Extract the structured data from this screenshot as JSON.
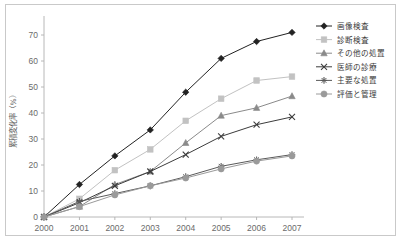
{
  "chart_data": {
    "type": "line",
    "title": "",
    "subtitle": "",
    "xlabel": "",
    "ylabel": "累積変化率（%）",
    "categories": [
      "2000",
      "2001",
      "2002",
      "2003",
      "2004",
      "2005",
      "2006",
      "2007"
    ],
    "x": [
      2000,
      2001,
      2002,
      2003,
      2004,
      2005,
      2006,
      2007
    ],
    "xlim": [
      2000,
      2007
    ],
    "ylim": [
      0,
      75
    ],
    "yticks": [
      0,
      10,
      20,
      30,
      40,
      50,
      60,
      70
    ],
    "ytick_labels": [
      "0",
      "10",
      "20",
      "30",
      "40",
      "50",
      "60",
      "70"
    ],
    "grid": false,
    "legend_position": "right",
    "series": [
      {
        "name": "画像検査",
        "marker": "diamond",
        "color": "#222222",
        "values": [
          0,
          12.5,
          23.5,
          33.5,
          48.0,
          61.0,
          67.5,
          71.0
        ]
      },
      {
        "name": "診断検査",
        "marker": "square",
        "color": "#c2c2c2",
        "values": [
          0,
          7.0,
          18.0,
          26.0,
          37.0,
          45.5,
          52.5,
          54.0
        ]
      },
      {
        "name": "その他の処置",
        "marker": "triangle",
        "color": "#8a8a8a",
        "values": [
          0,
          4.0,
          12.5,
          17.5,
          28.5,
          39.0,
          42.0,
          46.5
        ]
      },
      {
        "name": "医師の診療",
        "marker": "x",
        "color": "#3c3c3c",
        "values": [
          0,
          5.5,
          12.0,
          17.5,
          24.0,
          31.0,
          35.5,
          38.5
        ]
      },
      {
        "name": "主要な処置",
        "marker": "star",
        "color": "#5a5a5a",
        "values": [
          0,
          6.0,
          9.0,
          12.0,
          15.5,
          19.5,
          22.0,
          24.0
        ]
      },
      {
        "name": "評価と管理",
        "marker": "circle",
        "color": "#9a9a9a",
        "values": [
          0,
          4.0,
          8.5,
          12.0,
          15.0,
          18.5,
          21.5,
          23.5
        ]
      }
    ]
  }
}
